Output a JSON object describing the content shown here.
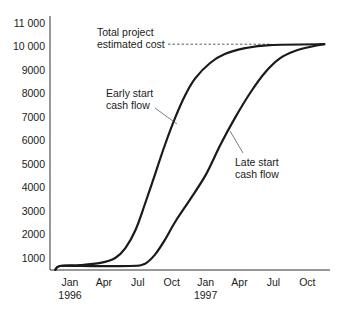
{
  "chart_data": {
    "type": "line",
    "title": "",
    "xlabel": "",
    "ylabel": "",
    "ylim": [
      500,
      11000
    ],
    "grid": false,
    "y_ticks": [
      1000,
      2000,
      3000,
      4000,
      5000,
      6000,
      7000,
      8000,
      9000,
      10000,
      11000
    ],
    "y_tick_labels": [
      "1000",
      "2000",
      "3000",
      "4000",
      "5000",
      "6000",
      "7000",
      "8000",
      "9000",
      "10 000",
      "11 000"
    ],
    "x_ticks": [
      {
        "label": "Jan",
        "sub": "1996",
        "month": 0
      },
      {
        "label": "Apr",
        "sub": "",
        "month": 3
      },
      {
        "label": "Jul",
        "sub": "",
        "month": 6
      },
      {
        "label": "Oct",
        "sub": "",
        "month": 9
      },
      {
        "label": "Jan",
        "sub": "1997",
        "month": 12
      },
      {
        "label": "Apr",
        "sub": "",
        "month": 15
      },
      {
        "label": "Jul",
        "sub": "",
        "month": 18
      },
      {
        "label": "Oct",
        "sub": "",
        "month": 21
      }
    ],
    "x_unit": "months from Jan 1996",
    "series": [
      {
        "name": "Early start cash flow",
        "x": [
          -1.3,
          -0.9,
          0.9,
          2.7,
          4.0,
          4.9,
          5.8,
          6.6,
          7.5,
          8.4,
          9.3,
          10.2,
          11.1,
          12.4,
          13.7,
          15.5,
          17.7,
          22.5
        ],
        "y": [
          500,
          660,
          700,
          790,
          1000,
          1420,
          2190,
          3250,
          4520,
          5800,
          6950,
          7920,
          8640,
          9280,
          9660,
          9910,
          10040,
          10080
        ]
      },
      {
        "name": "Late start cash flow",
        "x": [
          -1.3,
          -0.9,
          0.9,
          5.3,
          6.6,
          7.5,
          8.4,
          9.3,
          10.6,
          12.0,
          13.3,
          14.6,
          16.0,
          17.3,
          18.6,
          19.9,
          21.2,
          22.5
        ],
        "y": [
          500,
          660,
          660,
          660,
          750,
          1130,
          1770,
          2530,
          3470,
          4520,
          5800,
          6950,
          8050,
          8900,
          9490,
          9790,
          9960,
          10080
        ]
      }
    ],
    "reference_line": {
      "label": "Total project estimated cost",
      "value": 10080,
      "style": "dashed"
    },
    "annotations": [
      {
        "text": "Total project estimated cost",
        "target": "reference_line"
      },
      {
        "text": "Early start cash flow",
        "target": "Early start cash flow"
      },
      {
        "text": "Late start cash flow",
        "target": "Late start cash flow"
      }
    ],
    "legend": "none (direct labels)"
  },
  "labels": {
    "total_line1": "Total project",
    "total_line2": "estimated cost",
    "early_line1": "Early start",
    "early_line2": "cash flow",
    "late_line1": "Late start",
    "late_line2": "cash flow"
  },
  "colors": {
    "line": "#1a1a1a",
    "axis": "#333333",
    "background": "#ffffff"
  }
}
